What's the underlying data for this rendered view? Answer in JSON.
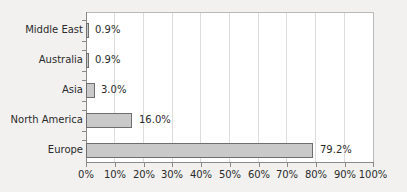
{
  "chart_data": {
    "type": "bar",
    "orientation": "horizontal",
    "title": "",
    "subtitle": "",
    "xlabel": "",
    "ylabel": "",
    "categories": [
      "Middle East",
      "Australia",
      "Asia",
      "North America",
      "Europe"
    ],
    "values": [
      0.9,
      0.9,
      3.0,
      16.0,
      79.2
    ],
    "value_labels": [
      "0.9%",
      "0.9%",
      "3.0%",
      "16.0%",
      "79.2%"
    ],
    "xlim": [
      0,
      100
    ],
    "xtick_values": [
      0,
      10,
      20,
      30,
      40,
      50,
      60,
      70,
      80,
      90,
      100
    ],
    "xtick_labels": [
      "0%",
      "10%",
      "20%",
      "30%",
      "40%",
      "50%",
      "60%",
      "70%",
      "80%",
      "90%",
      "100%"
    ],
    "grid": {
      "vertical": true,
      "horizontal": false
    },
    "legend": {
      "show": false,
      "position": "none"
    },
    "colors": {
      "bar_fill": "#c9c9c9",
      "bar_stroke": "#6e6e6e",
      "plot_background": "#ffffff",
      "figure_background": "#f2f1ef",
      "gridline": "#dcdcdc",
      "axis": "#8a8a8a",
      "text": "#2b2b2b"
    }
  }
}
